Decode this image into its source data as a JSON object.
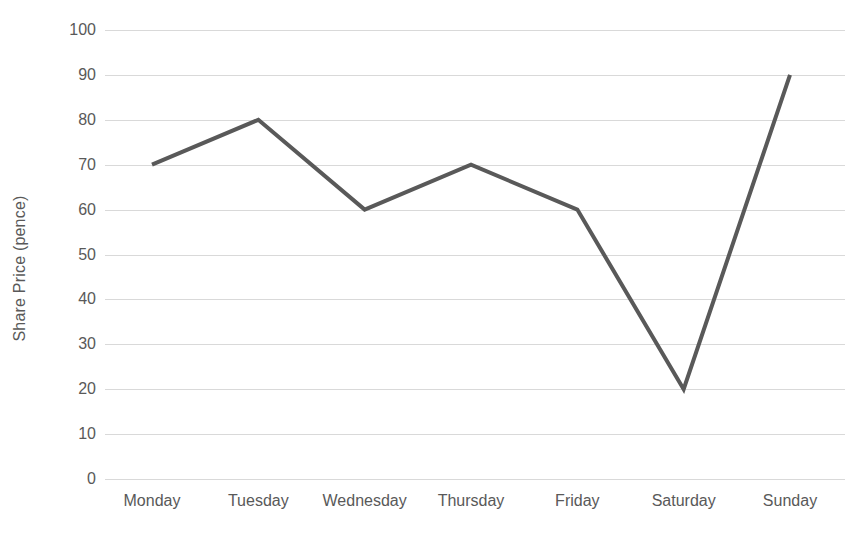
{
  "chart_data": {
    "type": "line",
    "title": "",
    "subtitle": "",
    "xlabel": "",
    "ylabel": "Share Price (pence)",
    "categories": [
      "Monday",
      "Tuesday",
      "Wednesday",
      "Thursday",
      "Friday",
      "Saturday",
      "Sunday"
    ],
    "values": [
      70,
      80,
      60,
      70,
      60,
      20,
      90
    ],
    "series": [
      {
        "name": "Share Price",
        "values": [
          70,
          80,
          60,
          70,
          60,
          20,
          90
        ]
      }
    ],
    "ylim": [
      0,
      100
    ],
    "ytick_step": 10,
    "yticks": [
      100,
      90,
      80,
      70,
      60,
      50,
      40,
      30,
      20,
      10,
      0
    ],
    "ytick_labels": [
      "100",
      "90",
      "80",
      "70",
      "60",
      "50",
      "40",
      "30",
      "20",
      "10",
      "0"
    ],
    "grid": "horizontal",
    "legend": "none",
    "annotations": [],
    "markers": "none",
    "colors": {
      "line": "#595959",
      "gridline": "#d9d9d9",
      "text": "#595959",
      "background": "#ffffff"
    },
    "line_width": 4
  }
}
